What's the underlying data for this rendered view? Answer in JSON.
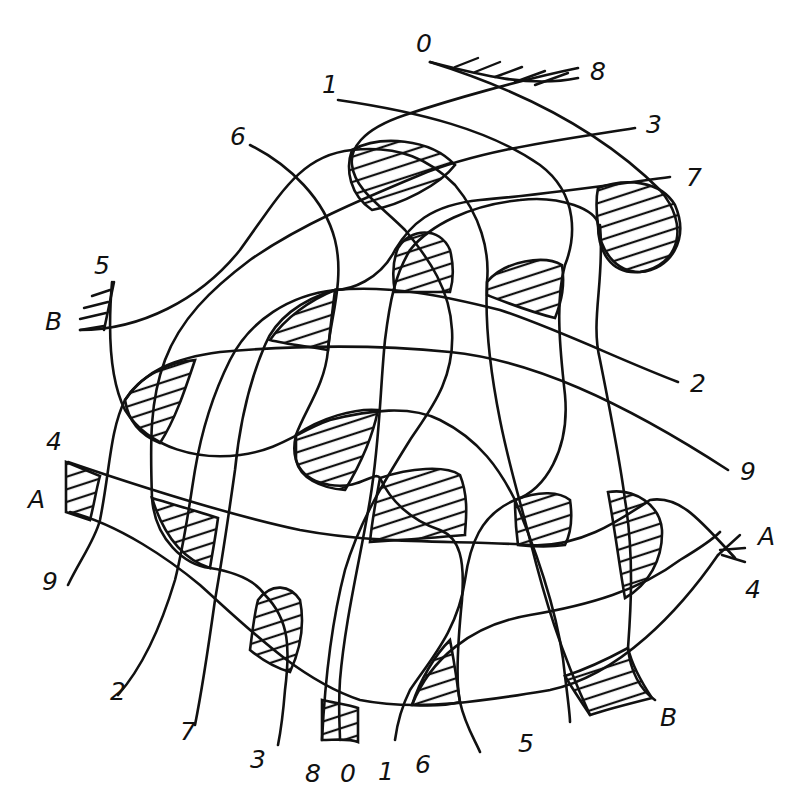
{
  "figure": {
    "type": "thread-interlacing diagram",
    "background": "#ffffff",
    "ink": "#111111"
  },
  "thread_end_labels": {
    "top": [
      {
        "id": "t0",
        "text": "0",
        "x": 416,
        "y": 52
      },
      {
        "id": "t8",
        "text": "8",
        "x": 590,
        "y": 80
      },
      {
        "id": "t1",
        "text": "1",
        "x": 322,
        "y": 93
      },
      {
        "id": "t3",
        "text": "3",
        "x": 646,
        "y": 133
      },
      {
        "id": "t6",
        "text": "6",
        "x": 230,
        "y": 145
      },
      {
        "id": "t7",
        "text": "7",
        "x": 686,
        "y": 186
      }
    ],
    "left": [
      {
        "id": "l5",
        "text": "5",
        "x": 94,
        "y": 274
      },
      {
        "id": "lB",
        "text": "B",
        "x": 45,
        "y": 330
      },
      {
        "id": "l4",
        "text": "4",
        "x": 46,
        "y": 450
      },
      {
        "id": "lA",
        "text": "A",
        "x": 28,
        "y": 508
      },
      {
        "id": "l9",
        "text": "9",
        "x": 42,
        "y": 590
      }
    ],
    "right": [
      {
        "id": "r2",
        "text": "2",
        "x": 690,
        "y": 392
      },
      {
        "id": "r9",
        "text": "9",
        "x": 740,
        "y": 480
      },
      {
        "id": "rA",
        "text": "A",
        "x": 758,
        "y": 545
      },
      {
        "id": "r4",
        "text": "4",
        "x": 745,
        "y": 598
      }
    ],
    "bottom": [
      {
        "id": "b2",
        "text": "2",
        "x": 110,
        "y": 700
      },
      {
        "id": "bB",
        "text": "B",
        "x": 660,
        "y": 726
      },
      {
        "id": "b7",
        "text": "7",
        "x": 180,
        "y": 740
      },
      {
        "id": "b5",
        "text": "5",
        "x": 518,
        "y": 752
      },
      {
        "id": "b3",
        "text": "3",
        "x": 250,
        "y": 768
      },
      {
        "id": "b8",
        "text": "8",
        "x": 305,
        "y": 782
      },
      {
        "id": "b0",
        "text": "0",
        "x": 340,
        "y": 782
      },
      {
        "id": "b1",
        "text": "1",
        "x": 378,
        "y": 780
      },
      {
        "id": "b6",
        "text": "6",
        "x": 415,
        "y": 773
      }
    ]
  },
  "anchors": [
    {
      "name": "anchor-0-8",
      "label_ends": [
        "0",
        "8"
      ],
      "position": "top"
    },
    {
      "name": "anchor-B-5",
      "label_ends": [
        "B",
        "5"
      ],
      "position": "left"
    },
    {
      "name": "anchor-A-4-left",
      "label_ends": [
        "A",
        "4"
      ],
      "position": "left"
    },
    {
      "name": "anchor-A-4-right",
      "label_ends": [
        "A",
        "4"
      ],
      "position": "right"
    }
  ],
  "threads": [
    {
      "name": "thread-0",
      "ends": [
        "0 (top)",
        "0 (bottom)"
      ]
    },
    {
      "name": "thread-1",
      "ends": [
        "1 (top)",
        "1 (bottom)"
      ]
    },
    {
      "name": "thread-2",
      "ends": [
        "2 (right)",
        "2 (bottom-left)"
      ]
    },
    {
      "name": "thread-3",
      "ends": [
        "3 (top-right)",
        "3 (bottom)"
      ]
    },
    {
      "name": "thread-4",
      "ends": [
        "4 (left)",
        "4 (right)"
      ]
    },
    {
      "name": "thread-5",
      "ends": [
        "5 (left)",
        "5 (bottom)"
      ]
    },
    {
      "name": "thread-6",
      "ends": [
        "6 (top-left)",
        "6 (bottom)"
      ]
    },
    {
      "name": "thread-7",
      "ends": [
        "7 (top-right)",
        "7 (bottom)"
      ]
    },
    {
      "name": "thread-8",
      "ends": [
        "8 (top)",
        "8 (bottom)"
      ]
    },
    {
      "name": "thread-9",
      "ends": [
        "9 (left)",
        "9 (right)"
      ]
    },
    {
      "name": "thread-A",
      "ends": [
        "A (left)",
        "A (right)"
      ]
    },
    {
      "name": "thread-B",
      "ends": [
        "B (left)",
        "B (bottom-right)"
      ]
    }
  ],
  "hatched_region_count": 16
}
